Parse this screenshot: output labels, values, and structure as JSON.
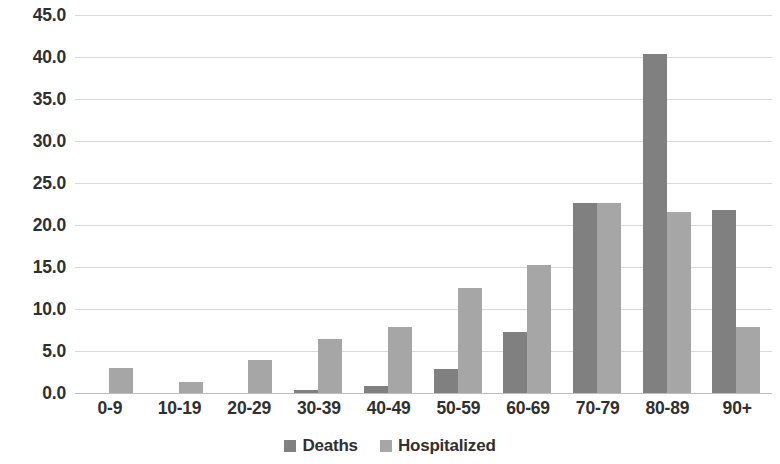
{
  "chart_data": {
    "type": "bar",
    "title": "",
    "subtitle": "",
    "xlabel": "",
    "ylabel": "",
    "categories": [
      "0-9",
      "10-19",
      "20-29",
      "30-39",
      "40-49",
      "50-59",
      "60-69",
      "70-79",
      "80-89",
      "90+"
    ],
    "series": [
      {
        "name": "Deaths",
        "color": "#808080",
        "values": [
          0.0,
          0.0,
          0.0,
          0.3,
          0.8,
          2.9,
          7.3,
          22.6,
          40.4,
          21.8
        ]
      },
      {
        "name": "Hospitalized",
        "color": "#a6a6a6",
        "values": [
          3.0,
          1.3,
          3.9,
          6.4,
          7.9,
          12.5,
          15.2,
          22.6,
          21.5,
          7.9
        ]
      }
    ],
    "ylim": [
      0.0,
      45.0
    ],
    "ytick_step": 5.0,
    "ytick_labels": [
      "45.0",
      "40.0",
      "35.0",
      "30.0",
      "25.0",
      "20.0",
      "15.0",
      "10.0",
      "5.0",
      "0.0"
    ],
    "ytick_values": [
      45.0,
      40.0,
      35.0,
      30.0,
      25.0,
      20.0,
      15.0,
      10.0,
      5.0,
      0.0
    ],
    "grid": true,
    "grid_orientation": "horizontal",
    "grid_color": "#d9d9d9",
    "legend_position": "bottom-center",
    "background_color": "#ffffff"
  },
  "legend": {
    "items": [
      {
        "label": "Deaths",
        "color": "#808080"
      },
      {
        "label": "Hospitalized",
        "color": "#a6a6a6"
      }
    ]
  }
}
